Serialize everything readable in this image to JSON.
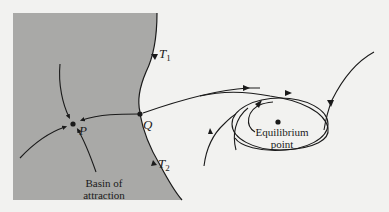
{
  "figure": {
    "colors": {
      "background": "#f2f2f0",
      "basin_fill": "#a9a9a7",
      "line": "#1a1a1a"
    },
    "points": {
      "P": {
        "label": "P"
      },
      "Q": {
        "label": "Q"
      },
      "equilibrium": {
        "label_line1": "Equilibrium",
        "label_line2": "point"
      }
    },
    "trajectories": {
      "T1": {
        "label": "T",
        "subscript": "1"
      },
      "T2": {
        "label": "T",
        "subscript": "2"
      }
    },
    "basin": {
      "label_line1": "Basin of",
      "label_line2": "attraction"
    }
  }
}
